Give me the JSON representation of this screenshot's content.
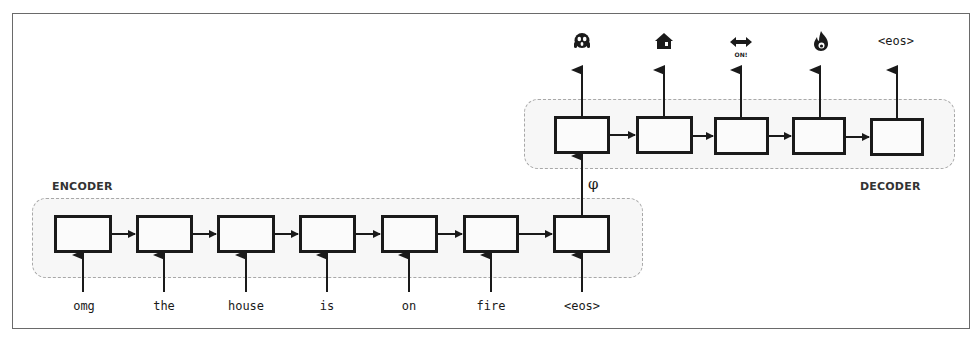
{
  "diagram": {
    "title": "",
    "encoder": {
      "label": "ENCODER",
      "inputs": [
        "omg",
        "the",
        "house",
        "is",
        "on",
        "fire",
        "<eos>"
      ],
      "cell_count": 7
    },
    "decoder": {
      "label": "DECODER",
      "outputs": [
        {
          "icon": "scream-face-icon",
          "glyph": "😱",
          "text": ""
        },
        {
          "icon": "house-icon",
          "glyph": "🏠",
          "text": ""
        },
        {
          "icon": "on-arrow-icon",
          "glyph": "⟷",
          "text": "ON!"
        },
        {
          "icon": "fire-icon",
          "glyph": "🔥",
          "text": ""
        },
        {
          "icon": "eos-token",
          "glyph": "",
          "text": "<eos>"
        }
      ],
      "cell_count": 5
    },
    "context_vector": "φ",
    "colors": {
      "stroke": "#1a1a1a",
      "dashed": "#a8a8a8",
      "group_fill": "#f7f7f7",
      "frame": "#6a6a6a"
    }
  }
}
